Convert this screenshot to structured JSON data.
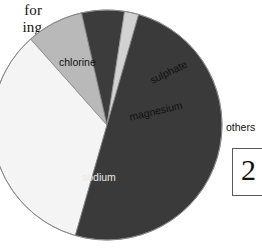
{
  "page": {
    "background_color": "#ffffff",
    "width": 262,
    "height": 252
  },
  "body_text": {
    "line1": "for",
    "line2": "ing",
    "line3": ","
  },
  "figure_badge": {
    "number": "2"
  },
  "chart_data": {
    "type": "pie",
    "title": "",
    "subtitle": "",
    "xlabel": "",
    "ylabel": "",
    "grid": false,
    "legend_position": "on-slice",
    "center": {
      "x": 107,
      "y": 125
    },
    "radius": 115,
    "start_angle_deg": 196,
    "direction": "clockwise",
    "categories": [
      "chlorine",
      "sulphate",
      "magnesium",
      "others",
      "sodium"
    ],
    "values": [
      34,
      8,
      6,
      2,
      50
    ],
    "unit": "%",
    "slices": [
      {
        "label": "chlorine",
        "value": 34,
        "color": "#f4f4f4",
        "label_color": "#111111",
        "start_angle_deg": 196,
        "end_angle_deg": 318.4,
        "label_rotation_deg": 0
      },
      {
        "label": "sulphate",
        "value": 8,
        "color": "#b9b9b9",
        "label_color": "#111111",
        "start_angle_deg": 318.4,
        "end_angle_deg": 347.2,
        "label_rotation_deg": -26
      },
      {
        "label": "magnesium",
        "value": 6,
        "color": "#3c3c3c",
        "label_color": "#111111",
        "start_angle_deg": 347.2,
        "end_angle_deg": 368.8,
        "label_rotation_deg": -13
      },
      {
        "label": "others",
        "value": 2,
        "color": "#d2d2d2",
        "label_color": "#111111",
        "start_angle_deg": 368.8,
        "end_angle_deg": 376.0,
        "label_rotation_deg": 0
      },
      {
        "label": "sodium",
        "value": 50,
        "color": "#3a3a3a",
        "label_color": "#e9e9e9",
        "start_angle_deg": 376.0,
        "end_angle_deg": 556.0,
        "label_rotation_deg": 0
      }
    ],
    "outline_color": "#8a8a8a"
  }
}
